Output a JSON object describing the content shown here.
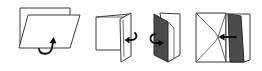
{
  "diagram": {
    "type": "folding-instructions",
    "background": "#ffffff",
    "colors": {
      "outline": "#3a3a3a",
      "shaded_panel": "#4a4a4a",
      "arrow": "#111111"
    },
    "steps": [
      {
        "index": 1,
        "name": "fold-sheet-up",
        "arrow": "curved-up",
        "description": "Front sheet folded as parallelogram over back sheet"
      },
      {
        "index": 2,
        "name": "fold-flap-left",
        "arrow": "left",
        "description": "Right flap folded inward toward left"
      },
      {
        "index": 3,
        "name": "turn-over-dark-panel",
        "arrow": "curved-right",
        "description": "Dark panel flipped over to the right"
      },
      {
        "index": 4,
        "name": "insert-into-envelope",
        "arrow": "left",
        "description": "Dark folded panel pushed left into envelope pocket"
      }
    ]
  }
}
